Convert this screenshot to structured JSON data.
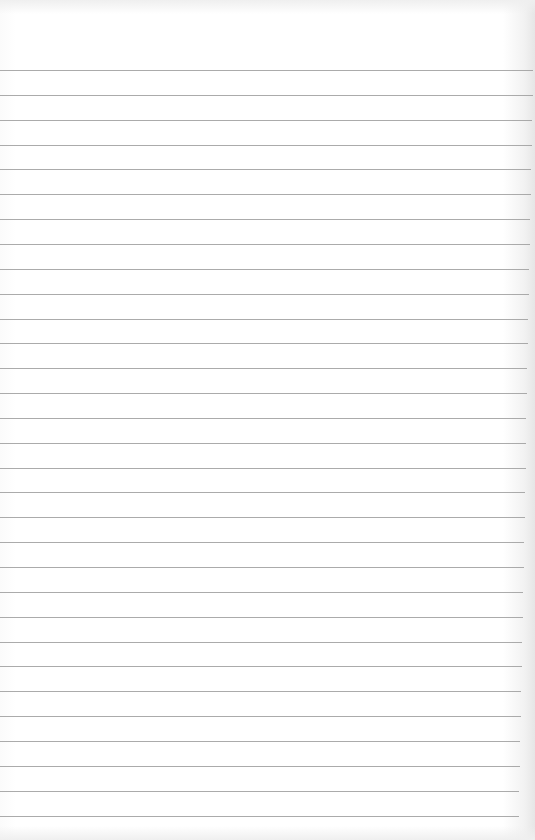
{
  "paper": {
    "type": "lined notebook paper",
    "background_color": "#ffffff",
    "line_color": "#9c9c9c",
    "line_count": 31,
    "first_line_y": 70,
    "line_spacing": 24.85,
    "line_start_x": 0,
    "line_end_x_top": 533,
    "line_end_x_bottom": 519
  }
}
